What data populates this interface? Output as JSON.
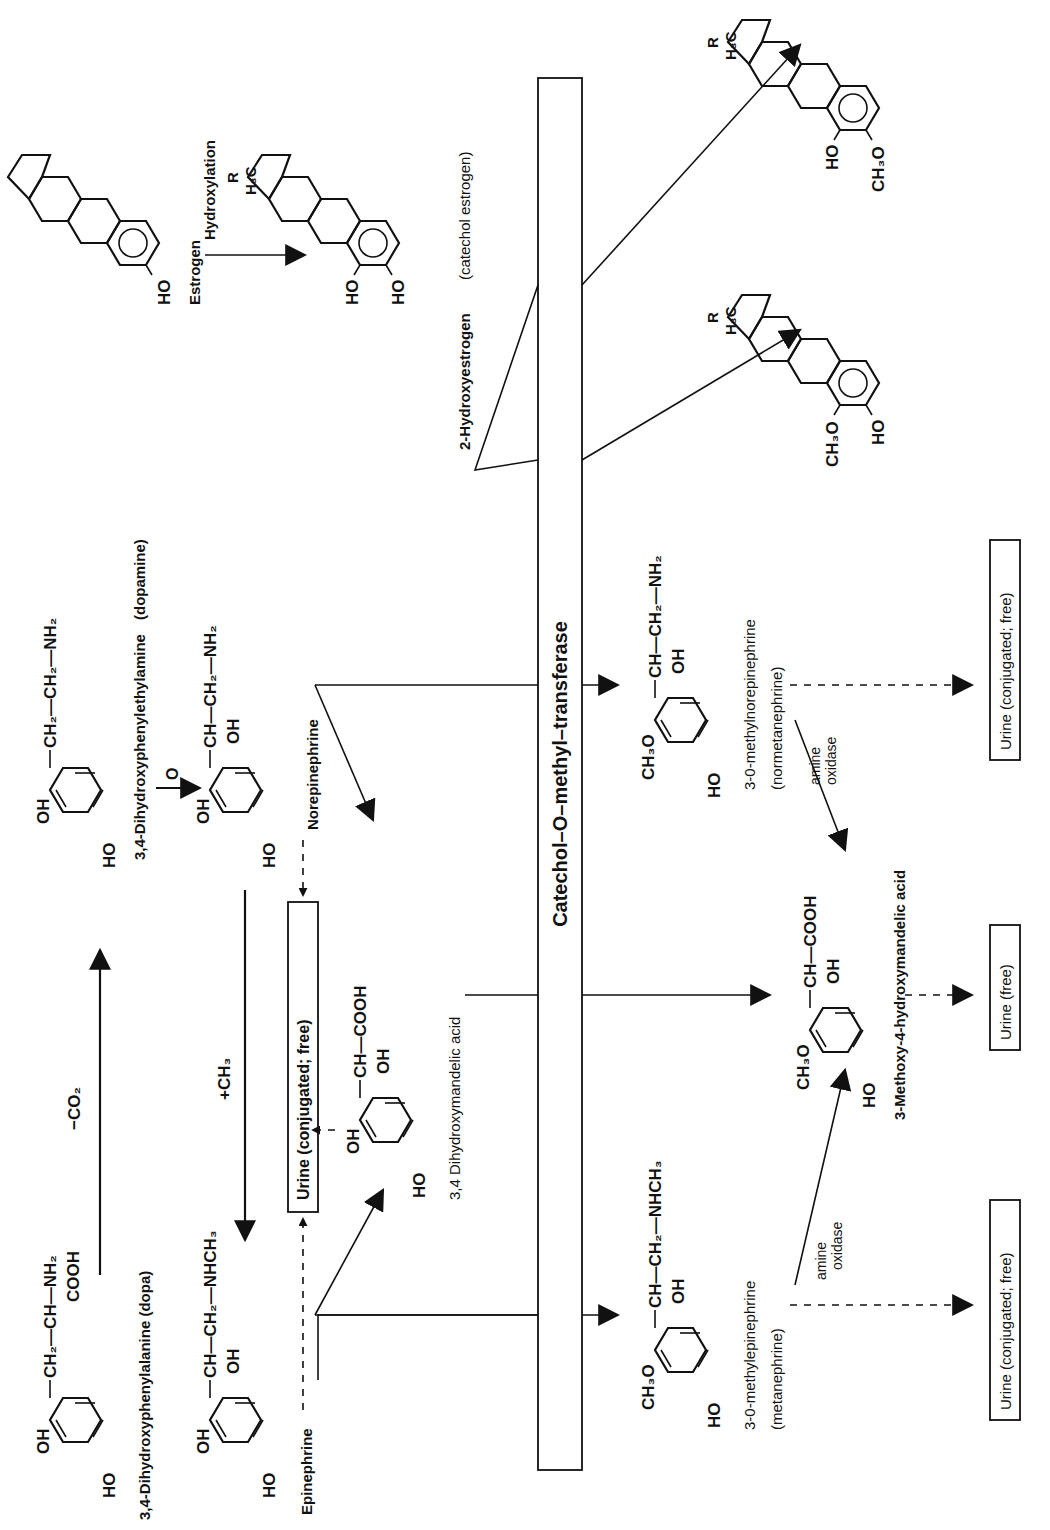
{
  "figure": {
    "orientation": "rotated 90 degrees counter-clockwise",
    "enzyme_bar": {
      "label": "Catechol–O–methyl–transferase"
    }
  },
  "compounds": {
    "dopa": {
      "name": "3,4-Dihydroxyphenylalanine  (dopa)",
      "ring_sub_top": "OH",
      "ring_sub_bottom": "HO",
      "side_chain": "CH₂—CH—NH₂",
      "side_branch": "COOH"
    },
    "dopamine": {
      "name": "3,4-Dihydroxyphenylethylamine",
      "alias": "(dopamine)",
      "ring_sub_top": "OH",
      "ring_sub_bottom": "HO",
      "side_chain": "CH₂—CH₂—NH₂"
    },
    "norepinephrine": {
      "name": "Norepinephrine",
      "ring_sub_top": "OH",
      "ring_sub_bottom": "HO",
      "side_chain": "CH—CH₂—NH₂",
      "side_branch": "OH"
    },
    "epinephrine": {
      "name": "Epinephrine",
      "ring_sub_top": "OH",
      "ring_sub_bottom": "HO",
      "side_chain": "CH—CH₂—NHCH₃",
      "side_branch": "OH"
    },
    "dihydroxymandelic": {
      "name": "3,4  Dihydroxymandelic  acid",
      "ring_sub_top": "OH",
      "ring_sub_bottom": "HO",
      "side_chain": "CH—COOH",
      "side_branch": "OH"
    },
    "normetanephrine": {
      "name": "3-0-methylnorepinephrine",
      "alias": "(normetanephrine)",
      "ring_sub_top": "CH₃O",
      "ring_sub_bottom": "HO",
      "side_chain": "CH—CH₂—NH₂",
      "side_branch": "OH"
    },
    "metanephrine": {
      "name": "3-0-methylepinephrine",
      "alias": "(metanephrine)",
      "ring_sub_top": "CH₃O",
      "ring_sub_bottom": "HO",
      "side_chain": "CH—CH₂—NHCH₃",
      "side_branch": "OH"
    },
    "vma": {
      "name": "3-Methoxy-4-hydroxymandelic  acid",
      "ring_sub_top": "CH₃O",
      "ring_sub_bottom": "HO",
      "side_chain": "CH—COOH",
      "side_branch": "OH"
    },
    "estrogen": {
      "name": "Estrogen",
      "ring_sub": "HO"
    },
    "hydroxyestrogen": {
      "name": "2-Hydroxyestrogen",
      "alias": "(catechol estrogen)",
      "ring_sub_top": "HO",
      "ring_sub_bottom": "HO",
      "methyl": "H₃C",
      "r_group": "R"
    },
    "methoxyestrogen_a": {
      "ring_sub_top": "CH₃O",
      "ring_sub_bottom": "HO",
      "methyl": "H₃C",
      "r_group": "R"
    },
    "methoxyestrogen_b": {
      "ring_sub_top": "HO",
      "ring_sub_bottom": "CH₃O",
      "methyl": "H₃C",
      "r_group": "R"
    }
  },
  "reactions": {
    "decarboxylation": "−CO₂",
    "oxidation": "O",
    "methylation": "+CH₃",
    "hydroxylation": "Hydroxylation",
    "amine_oxidase_1": [
      "amine",
      "oxidase"
    ],
    "amine_oxidase_2": [
      "amine",
      "oxidase"
    ]
  },
  "excretion": {
    "urine_top": "Urine (conjugated; free)",
    "urine_metanephrine": "Urine  (conjugated; free)",
    "urine_vma": "Urine  (free)",
    "urine_normetanephrine": "Urine  (conjugated; free)"
  }
}
